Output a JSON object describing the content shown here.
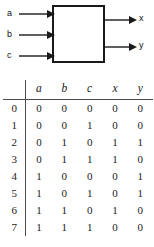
{
  "diagram": {
    "name": "black-box-logic-block",
    "inputs": [
      {
        "label": "a"
      },
      {
        "label": "b"
      },
      {
        "label": "c"
      }
    ],
    "outputs": [
      {
        "label": "x"
      },
      {
        "label": "y"
      }
    ],
    "box_label": "",
    "stroke_color": "#1a1a1a"
  },
  "truth_table": {
    "index_header": "",
    "columns": [
      "a",
      "b",
      "c",
      "x",
      "y"
    ],
    "rows": [
      {
        "index": "0",
        "cells": [
          "0",
          "0",
          "0",
          "0",
          "0"
        ]
      },
      {
        "index": "1",
        "cells": [
          "0",
          "0",
          "1",
          "0",
          "0"
        ]
      },
      {
        "index": "2",
        "cells": [
          "0",
          "1",
          "0",
          "1",
          "1"
        ]
      },
      {
        "index": "3",
        "cells": [
          "0",
          "1",
          "1",
          "1",
          "0"
        ]
      },
      {
        "index": "4",
        "cells": [
          "1",
          "0",
          "0",
          "0",
          "1"
        ]
      },
      {
        "index": "5",
        "cells": [
          "1",
          "0",
          "1",
          "0",
          "1"
        ]
      },
      {
        "index": "6",
        "cells": [
          "1",
          "1",
          "0",
          "1",
          "0"
        ]
      },
      {
        "index": "7",
        "cells": [
          "1",
          "1",
          "1",
          "0",
          "0"
        ]
      }
    ]
  }
}
